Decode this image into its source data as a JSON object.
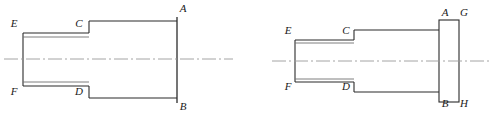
{
  "drawing": {
    "title": "Two orthographic sectional views of a stepped shaft",
    "stroke_color": "#2b2b2b",
    "centerline_color": "#8a8a8a",
    "background_color": "#ffffff",
    "line_width": 1
  },
  "figures": [
    {
      "id": "figure-left",
      "name": "stepped-shaft-without-flange",
      "parts": [
        {
          "name": "small-diameter-shaft",
          "type": "tube"
        },
        {
          "name": "large-diameter-shaft",
          "type": "cylinder"
        }
      ],
      "labels": [
        {
          "key": "E",
          "text": "E",
          "x": 14,
          "y": 27,
          "anchor": "middle",
          "role": "small-shaft-top-left"
        },
        {
          "key": "C",
          "text": "C",
          "x": 79,
          "y": 27,
          "anchor": "middle",
          "role": "small-shaft-top-right"
        },
        {
          "key": "A",
          "text": "A",
          "x": 183,
          "y": 12,
          "anchor": "middle",
          "role": "end-face-top"
        },
        {
          "key": "F",
          "text": "F",
          "x": 14,
          "y": 95,
          "anchor": "middle",
          "role": "small-shaft-bottom-left"
        },
        {
          "key": "D",
          "text": "D",
          "x": 79,
          "y": 95,
          "anchor": "middle",
          "role": "small-shaft-bottom-right"
        },
        {
          "key": "B",
          "text": "B",
          "x": 183,
          "y": 110,
          "anchor": "middle",
          "role": "end-face-bottom"
        }
      ],
      "geometry": {
        "small_shaft": {
          "x1": 23,
          "x2": 89,
          "top": 33,
          "bottom": 86,
          "wall": 4
        },
        "large_shaft": {
          "x1": 89,
          "x2": 177,
          "top": 21,
          "bottom": 98
        },
        "end_line": {
          "x": 177,
          "y1": 17,
          "y2": 103
        },
        "centerline": {
          "y": 59,
          "x1": 4,
          "x2": 233
        }
      }
    },
    {
      "id": "figure-right",
      "name": "stepped-shaft-with-end-flange",
      "parts": [
        {
          "name": "small-diameter-shaft",
          "type": "tube"
        },
        {
          "name": "large-diameter-shaft",
          "type": "cylinder"
        },
        {
          "name": "end-flange-plate",
          "type": "rectangle"
        }
      ],
      "labels": [
        {
          "key": "E",
          "text": "E",
          "x": 36,
          "y": 34,
          "anchor": "middle",
          "role": "small-shaft-top-left"
        },
        {
          "key": "C",
          "text": "C",
          "x": 94,
          "y": 34,
          "anchor": "middle",
          "role": "small-shaft-top-right"
        },
        {
          "key": "A",
          "text": "A",
          "x": 193,
          "y": 16,
          "anchor": "middle",
          "role": "flange-left-top"
        },
        {
          "key": "G",
          "text": "G",
          "x": 212,
          "y": 16,
          "anchor": "middle",
          "role": "flange-right-top"
        },
        {
          "key": "F",
          "text": "F",
          "x": 36,
          "y": 90,
          "anchor": "middle",
          "role": "small-shaft-bottom-left"
        },
        {
          "key": "D",
          "text": "D",
          "x": 94,
          "y": 90,
          "anchor": "middle",
          "role": "small-shaft-bottom-right"
        },
        {
          "key": "B",
          "text": "B",
          "x": 193,
          "y": 107,
          "anchor": "middle",
          "role": "flange-left-bottom"
        },
        {
          "key": "H",
          "text": "H",
          "x": 212,
          "y": 107,
          "anchor": "middle",
          "role": "flange-right-bottom"
        }
      ],
      "geometry": {
        "small_shaft": {
          "x1": 43,
          "x2": 102,
          "top": 40,
          "bottom": 82,
          "wall": 3
        },
        "large_shaft": {
          "x1": 102,
          "x2": 187,
          "top": 30,
          "bottom": 92
        },
        "flange": {
          "x1": 187,
          "x2": 207,
          "top": 20,
          "bottom": 102
        },
        "centerline": {
          "y": 61,
          "x1": 20,
          "x2": 238
        }
      }
    }
  ]
}
